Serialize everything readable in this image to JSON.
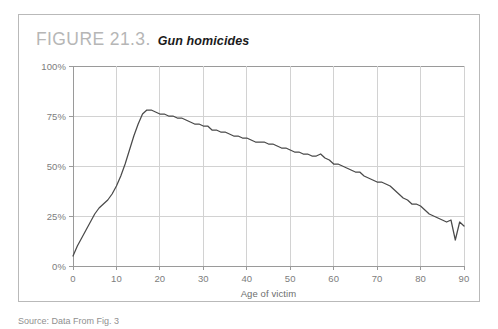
{
  "figure": {
    "number": "FIGURE 21.3.",
    "caption": "Gun homicides",
    "source_note": "Source: Data From Fig. 3"
  },
  "axis": {
    "y_ticks": [
      "0%",
      "25%",
      "50%",
      "75%",
      "100%"
    ],
    "x_ticks": [
      "0",
      "10",
      "20",
      "30",
      "40",
      "50",
      "60",
      "70",
      "80",
      "90"
    ],
    "x_title": "Age of victim"
  },
  "colors": {
    "line": "#4a4a4a",
    "grid": "#d2d2d2",
    "axis": "#9a9a9a",
    "frame": "#b9b9b9",
    "figure_number": "#b6b6b6",
    "tick_text": "#7d7d7d"
  },
  "chart_data": {
    "type": "line",
    "title": "Gun homicides",
    "xlabel": "Age of victim",
    "ylabel": "",
    "xlim": [
      0,
      90
    ],
    "ylim": [
      0,
      100
    ],
    "ytick_values": [
      0,
      25,
      50,
      75,
      100
    ],
    "ytick_labels": [
      "0%",
      "25%",
      "50%",
      "75%",
      "100%"
    ],
    "xtick_values": [
      0,
      10,
      20,
      30,
      40,
      50,
      60,
      70,
      80,
      90
    ],
    "grid": true,
    "legend": false,
    "units": "percent of homicides committed with a gun",
    "x": [
      0,
      1,
      2,
      3,
      4,
      5,
      6,
      7,
      8,
      9,
      10,
      11,
      12,
      13,
      14,
      15,
      16,
      17,
      18,
      19,
      20,
      21,
      22,
      23,
      24,
      25,
      26,
      27,
      28,
      29,
      30,
      31,
      32,
      33,
      34,
      35,
      36,
      37,
      38,
      39,
      40,
      41,
      42,
      43,
      44,
      45,
      46,
      47,
      48,
      49,
      50,
      51,
      52,
      53,
      54,
      55,
      56,
      57,
      58,
      59,
      60,
      61,
      62,
      63,
      64,
      65,
      66,
      67,
      68,
      69,
      70,
      71,
      72,
      73,
      74,
      75,
      76,
      77,
      78,
      79,
      80,
      81,
      82,
      83,
      84,
      85,
      86,
      87,
      88,
      89,
      90
    ],
    "values": [
      5,
      10,
      14,
      18,
      22,
      26,
      29,
      31,
      33,
      36,
      40,
      45,
      51,
      58,
      65,
      71,
      76,
      78,
      78,
      77,
      76,
      76,
      75,
      75,
      74,
      74,
      73,
      72,
      71,
      71,
      70,
      70,
      68,
      68,
      67,
      67,
      66,
      65,
      65,
      64,
      64,
      63,
      62,
      62,
      62,
      61,
      61,
      60,
      59,
      59,
      58,
      57,
      57,
      56,
      56,
      55,
      55,
      56,
      54,
      53,
      51,
      51,
      50,
      49,
      48,
      47,
      47,
      45,
      44,
      43,
      42,
      42,
      41,
      40,
      38,
      36,
      34,
      33,
      31,
      31,
      30,
      28,
      26,
      25,
      24,
      23,
      22,
      23,
      13,
      22,
      20
    ]
  }
}
